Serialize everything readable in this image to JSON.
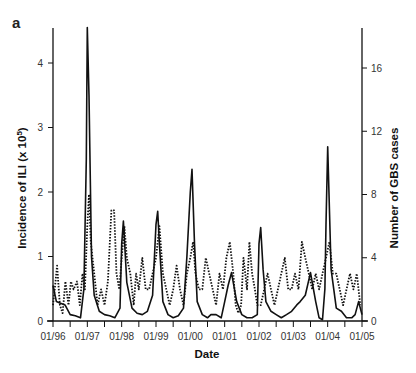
{
  "panel_label": "a",
  "chart_data": {
    "type": "line",
    "title": "",
    "panel": "a",
    "xlabel": "Date",
    "ylabel_left": "Incidence of ILI (x 10^5)",
    "ylabel_right": "Number of GBS cases",
    "x_tick_labels": [
      "01/96",
      "01/97",
      "01/98",
      "01/99",
      "01/00",
      "01/01",
      "01/02",
      "01/03",
      "01/04",
      "01/05"
    ],
    "x_range": [
      1996.0,
      2005.0
    ],
    "ylim_left": [
      0,
      4.6
    ],
    "yticks_left": [
      0,
      1,
      2,
      3,
      4
    ],
    "ylim_right": [
      0,
      18.4
    ],
    "yticks_right": [
      0,
      4,
      8,
      12,
      16
    ],
    "grid": false,
    "legend": "none",
    "series": [
      {
        "name": "ILI incidence",
        "axis": "left",
        "style": "solid",
        "x": [
          1996.0,
          1996.1,
          1996.2,
          1996.35,
          1996.5,
          1996.65,
          1996.8,
          1996.9,
          1996.97,
          1997.0,
          1997.05,
          1997.12,
          1997.2,
          1997.35,
          1997.5,
          1997.65,
          1997.8,
          1997.95,
          1998.0,
          1998.05,
          1998.15,
          1998.3,
          1998.45,
          1998.6,
          1998.75,
          1998.9,
          1999.0,
          1999.05,
          1999.1,
          1999.2,
          1999.35,
          1999.5,
          1999.65,
          1999.8,
          1999.9,
          2000.0,
          2000.05,
          2000.12,
          2000.2,
          2000.35,
          2000.5,
          2000.6,
          2000.75,
          2000.9,
          2001.0,
          2001.1,
          2001.2,
          2001.35,
          2001.5,
          2001.65,
          2001.8,
          2001.95,
          2002.0,
          2002.05,
          2002.12,
          2002.2,
          2002.35,
          2002.5,
          2002.65,
          2002.8,
          2002.95,
          2003.1,
          2003.2,
          2003.35,
          2003.5,
          2003.65,
          2003.75,
          2003.85,
          2003.92,
          2003.95,
          2004.0,
          2004.1,
          2004.25,
          2004.4,
          2004.55,
          2004.7,
          2004.8,
          2004.9,
          2005.0
        ],
        "values": [
          0.55,
          0.3,
          0.28,
          0.25,
          0.1,
          0.08,
          0.05,
          0.5,
          2.5,
          4.55,
          3.5,
          1.0,
          0.4,
          0.15,
          0.1,
          0.08,
          0.05,
          0.2,
          1.2,
          1.55,
          0.6,
          0.2,
          0.12,
          0.1,
          0.15,
          0.4,
          1.5,
          1.7,
          1.2,
          0.3,
          0.1,
          0.05,
          0.08,
          0.2,
          1.0,
          2.0,
          2.35,
          1.2,
          0.3,
          0.1,
          0.05,
          0.1,
          0.1,
          0.05,
          0.3,
          0.55,
          0.75,
          0.3,
          0.1,
          0.05,
          0.05,
          0.1,
          1.2,
          1.45,
          0.8,
          0.3,
          0.15,
          0.1,
          0.05,
          0.1,
          0.15,
          0.25,
          0.3,
          0.4,
          0.75,
          0.3,
          0.05,
          0.02,
          0.5,
          1.5,
          2.7,
          0.8,
          0.2,
          0.15,
          0.05,
          0.05,
          0.1,
          0.3,
          0.1
        ]
      },
      {
        "name": "GBS cases",
        "axis": "right",
        "style": "dotted",
        "x": [
          1996.0,
          1996.05,
          1996.12,
          1996.2,
          1996.28,
          1996.36,
          1996.45,
          1996.52,
          1996.6,
          1996.7,
          1996.78,
          1996.86,
          1996.93,
          1997.0,
          1997.05,
          1997.1,
          1997.2,
          1997.3,
          1997.4,
          1997.5,
          1997.6,
          1997.7,
          1997.78,
          1997.85,
          1997.93,
          1998.0,
          1998.08,
          1998.15,
          1998.25,
          1998.35,
          1998.42,
          1998.5,
          1998.6,
          1998.7,
          1998.8,
          1998.9,
          1999.0,
          1999.1,
          1999.2,
          1999.3,
          1999.4,
          1999.5,
          1999.6,
          1999.7,
          1999.8,
          1999.9,
          2000.0,
          2000.08,
          2000.15,
          2000.25,
          2000.35,
          2000.45,
          2000.55,
          2000.65,
          2000.75,
          2000.85,
          2000.95,
          2001.05,
          2001.15,
          2001.25,
          2001.32,
          2001.4,
          2001.48,
          2001.55,
          2001.65,
          2001.72,
          2001.8,
          2001.88,
          2001.95,
          2002.05,
          2002.15,
          2002.25,
          2002.35,
          2002.45,
          2002.55,
          2002.65,
          2002.75,
          2002.85,
          2002.95,
          2003.05,
          2003.15,
          2003.25,
          2003.35,
          2003.45,
          2003.55,
          2003.65,
          2003.75,
          2003.85,
          2003.95,
          2004.05,
          2004.15,
          2004.25,
          2004.35,
          2004.45,
          2004.55,
          2004.65,
          2004.75,
          2004.85,
          2004.95
        ],
        "values": [
          1,
          2,
          3.5,
          1,
          0.5,
          2.5,
          1,
          2.5,
          2,
          2.5,
          1,
          3,
          2,
          6,
          8,
          5,
          3,
          1,
          2,
          1,
          2.5,
          7,
          7,
          3,
          2,
          4,
          6,
          4,
          3,
          1,
          3,
          2,
          4,
          2,
          2,
          3,
          4,
          6,
          3,
          2,
          1,
          2,
          3.5,
          2,
          1,
          3,
          4,
          5,
          3,
          2,
          2,
          4,
          3,
          2,
          1,
          3,
          2,
          4,
          5,
          3,
          1,
          0.5,
          1,
          4,
          2,
          5,
          3,
          2,
          1,
          1,
          2,
          3,
          2,
          1,
          2,
          3,
          4,
          2,
          2,
          3,
          2,
          5,
          4,
          3,
          2,
          3,
          2,
          3,
          4,
          5,
          3,
          3,
          2,
          1,
          2,
          3,
          2,
          3,
          1
        ]
      }
    ]
  }
}
